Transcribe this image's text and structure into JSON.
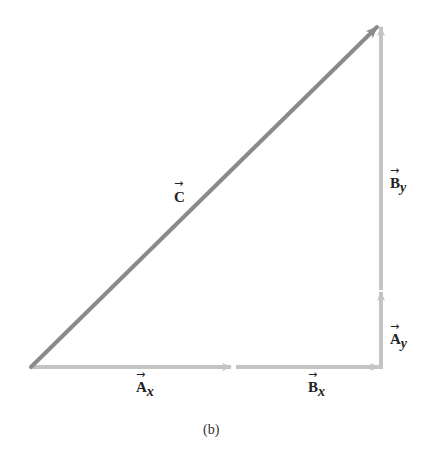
{
  "figure": {
    "caption": "(b)",
    "colors": {
      "resultant": "#8a8a8a",
      "component": "#c4c4c4",
      "text": "#222222"
    },
    "vectors": [
      {
        "id": "Ax",
        "symbol": "A",
        "subscript": "x",
        "from": [
          31,
          367
        ],
        "to": [
          233,
          367
        ]
      },
      {
        "id": "Bx",
        "symbol": "B",
        "subscript": "x",
        "from": [
          236,
          367
        ],
        "to": [
          381,
          367
        ]
      },
      {
        "id": "Ay",
        "symbol": "A",
        "subscript": "y",
        "from": [
          381,
          367
        ],
        "to": [
          381,
          290
        ]
      },
      {
        "id": "By",
        "symbol": "B",
        "subscript": "y",
        "from": [
          381,
          292
        ],
        "to": [
          381,
          24
        ]
      },
      {
        "id": "C",
        "symbol": "C",
        "subscript": "",
        "from": [
          31,
          367
        ],
        "to": [
          379,
          25
        ]
      }
    ],
    "labels": {
      "C": {
        "main": "C",
        "sub": ""
      },
      "By": {
        "main": "B",
        "sub": "y"
      },
      "Ay": {
        "main": "A",
        "sub": "y"
      },
      "Ax": {
        "main": "A",
        "sub": "x"
      },
      "Bx": {
        "main": "B",
        "sub": "x"
      }
    }
  }
}
